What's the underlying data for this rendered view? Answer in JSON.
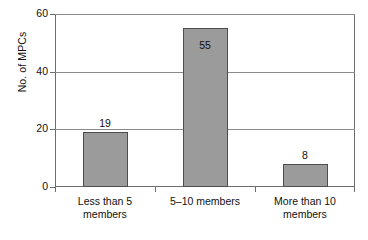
{
  "chart_data": {
    "type": "bar",
    "title": "",
    "subtitle": "",
    "xlabel": "",
    "ylabel": "No. of MPCs",
    "categories": [
      "Less than 5\nmembers",
      "5–10 members",
      "More than 10\nmembers"
    ],
    "values": [
      19,
      55,
      8
    ],
    "data_labels": [
      "19",
      "55",
      "8"
    ],
    "series": [
      {
        "name": "No. of MPCs",
        "values": [
          19,
          55,
          8
        ]
      }
    ],
    "ylim": [
      0,
      60
    ],
    "y_ticks": [
      0,
      20,
      40,
      60
    ],
    "y_tick_labels": [
      "0",
      "20",
      "40",
      "60"
    ],
    "grid": "horizontal",
    "legend": "none",
    "bar_fill_color": "#9b9b9b",
    "bar_border_color": "#4d4d4d",
    "axis_color": "#6d6d6d",
    "gridline_color": "#8a8a8a",
    "background_color": "#ffffff",
    "label_positions": [
      "above",
      "inside-top",
      "above"
    ]
  }
}
